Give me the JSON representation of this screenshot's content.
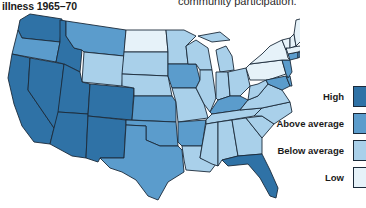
{
  "header": {
    "title": "illness 1965–70",
    "caption": "community participation."
  },
  "legend": {
    "items": [
      {
        "label": "High",
        "color": "#2f72a6"
      },
      {
        "label": "Above average",
        "color": "#5b9ccc"
      },
      {
        "label": "Below average",
        "color": "#a9d0ea"
      },
      {
        "label": "Low",
        "color": "#e6f2f9"
      }
    ]
  },
  "map": {
    "classes": {
      "high": "#2f72a6",
      "above": "#5b9ccc",
      "below": "#a9d0ea",
      "low": "#e6f2f9"
    },
    "states": {
      "WA": "high",
      "OR": "above",
      "CA": "high",
      "NV": "high",
      "ID": "high",
      "MT": "above",
      "WY": "below",
      "UT": "high",
      "AZ": "high",
      "CO": "high",
      "NM": "high",
      "ND": "low",
      "SD": "below",
      "NE": "below",
      "KS": "above",
      "OK": "above",
      "TX": "above",
      "MN": "below",
      "IA": "above",
      "MO": "below",
      "AR": "above",
      "LA": "below",
      "WI": "below",
      "IL": "below",
      "MI": "below",
      "IN": "below",
      "OH": "below",
      "KY": "above",
      "TN": "below",
      "MS": "below",
      "AL": "below",
      "GA": "below",
      "FL": "high",
      "SC": "below",
      "NC": "below",
      "VA": "below",
      "WV": "below",
      "PA": "low",
      "NY": "low",
      "VT": "low",
      "NH": "low",
      "ME": "low",
      "MA": "low",
      "CT": "above",
      "RI": "above",
      "NJ": "above",
      "DE": "above",
      "MD": "above"
    }
  }
}
